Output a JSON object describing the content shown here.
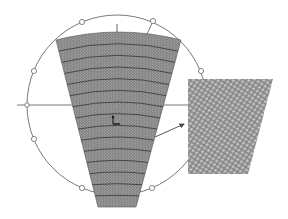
{
  "diagram": {
    "title": "",
    "colors": {
      "background": "#ffffff",
      "outline": "#6a6a6a",
      "fan_fill": "#7d7d7d",
      "fan_dots": "#b8b8b8",
      "band_lines": "#3a3a3a",
      "inset_fill": "#8c8c8c",
      "inset_dots": "#c8c8c8",
      "arrow": "#444444"
    },
    "circle": {
      "cx": 117,
      "cy": 105,
      "r": 90
    },
    "marker_circles": [
      {
        "x": 82,
        "y": 22
      },
      {
        "x": 153,
        "y": 21
      },
      {
        "x": 34,
        "y": 71
      },
      {
        "x": 201,
        "y": 71
      },
      {
        "x": 34,
        "y": 139
      },
      {
        "x": 82,
        "y": 188
      },
      {
        "x": 152,
        "y": 188
      }
    ],
    "axis_node": {
      "x": 27,
      "y": 105
    },
    "horizontal_axis": {
      "x1": 17,
      "x2": 188,
      "y": 105
    },
    "top_tick": {
      "x": 117,
      "y1": 24,
      "y2": 34
    },
    "radial_line": {
      "x1": 153,
      "y1": 21,
      "x2": 147,
      "y2": 34
    },
    "fan": {
      "top_left": [
        56,
        40
      ],
      "top_right": [
        181,
        40
      ],
      "top_apex_y": 32,
      "bottom_left": [
        98,
        207
      ],
      "bottom_right": [
        136,
        207
      ],
      "band_count": 15
    },
    "inset": {
      "top_left": [
        188,
        79
      ],
      "top_right": [
        273,
        79
      ],
      "bottom_right": [
        248,
        174
      ],
      "bottom_left": [
        188,
        174
      ]
    },
    "pointer_arrow": {
      "x1": 155,
      "y1": 137,
      "x2": 184,
      "y2": 124
    },
    "origin_marker": {
      "x": 113,
      "y": 124
    }
  }
}
